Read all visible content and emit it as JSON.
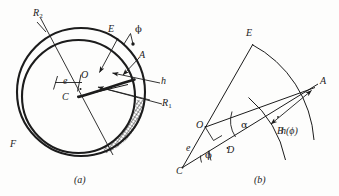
{
  "figure": {
    "caption_a": "(a)",
    "caption_b": "(b)",
    "panel_a": {
      "name": "journal-bearing-cross-section",
      "labels": {
        "R2": "R",
        "R2_sub": "2",
        "R1": "R",
        "R1_sub": "1",
        "E": "E",
        "A": "A",
        "h": "h",
        "O": "O",
        "C": "C",
        "e": "e",
        "F": "F",
        "phi": "ϕ"
      }
    },
    "panel_b": {
      "name": "film-thickness-geometry-detail",
      "labels": {
        "E": "E",
        "A": "A",
        "B": "B",
        "O": "O",
        "C": "C",
        "D": "D",
        "e": "e",
        "phi": "ϕ",
        "alpha": "α",
        "h_phi": "h(ϕ)"
      }
    }
  },
  "style": {
    "ink": "#1c1c1c",
    "line": "#262626",
    "background": "#fdfdfc",
    "hatch": "#3a3a3a"
  }
}
